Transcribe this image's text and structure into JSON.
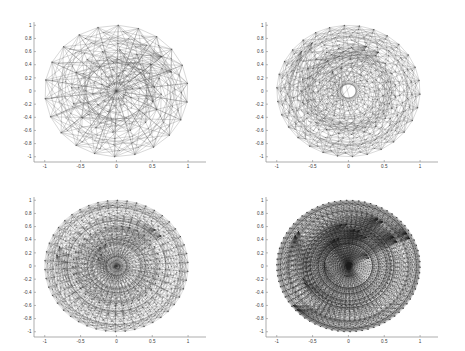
{
  "figure": {
    "title": "",
    "background": "#ffffff",
    "layout": "2x2 subplot grid",
    "width": 465,
    "height": 351
  },
  "chart_data": [
    {
      "type": "scatter",
      "name": "mesh-level-1",
      "position": "top-left",
      "title": "",
      "xlabel": "",
      "ylabel": "",
      "xlim": [
        -1.15,
        1.25
      ],
      "ylim": [
        -1.08,
        1.05
      ],
      "xticks": [
        -1,
        -0.5,
        0,
        0.5,
        1
      ],
      "xticklabels": [
        "-1",
        "-0.5",
        "0",
        "0.5",
        "1"
      ],
      "yticks": [
        -1,
        -0.8,
        -0.6,
        -0.4,
        -0.2,
        0,
        0.2,
        0.4,
        0.6,
        0.8,
        1
      ],
      "yticklabels": [
        "-1",
        "-0.8",
        "-0.6",
        "-0.4",
        "-0.2",
        "0",
        "0.2",
        "0.4",
        "0.6",
        "0.8",
        "1"
      ],
      "grid": false,
      "legend": "none",
      "rings": 9,
      "sectors": 22,
      "inner_radius": 0.11,
      "outer_radius": 1.0,
      "line_color": "#4a4a4a",
      "line_width": 0.22,
      "description": "Sparse circular radial mesh: concentric node rings connected by chords forming a rose/triangulation pattern with circular voids"
    },
    {
      "type": "scatter",
      "name": "mesh-level-2",
      "position": "top-right",
      "title": "",
      "xlabel": "",
      "ylabel": "",
      "xlim": [
        -1.15,
        1.25
      ],
      "ylim": [
        -1.08,
        1.05
      ],
      "xticks": [
        -1,
        -0.5,
        0,
        0.5,
        1
      ],
      "xticklabels": [
        "-1",
        "-0.5",
        "0",
        "0.5",
        "1"
      ],
      "yticks": [
        -1,
        -0.8,
        -0.6,
        -0.4,
        -0.2,
        0,
        0.2,
        0.4,
        0.6,
        0.8,
        1
      ],
      "yticklabels": [
        "-1",
        "-0.8",
        "-0.6",
        "-0.4",
        "-0.2",
        "0",
        "0.2",
        "0.4",
        "0.6",
        "0.8",
        "1"
      ],
      "grid": false,
      "legend": "none",
      "rings": 14,
      "sectors": 30,
      "inner_radius": 0.16,
      "outer_radius": 1.0,
      "line_color": "#3d3d3d",
      "line_width": 0.2,
      "description": "Refined circular radial mesh, roughly double node density, larger central void"
    },
    {
      "type": "scatter",
      "name": "mesh-level-3",
      "position": "bottom-left",
      "title": "",
      "xlabel": "",
      "ylabel": "",
      "xlim": [
        -1.15,
        1.25
      ],
      "ylim": [
        -1.08,
        1.05
      ],
      "xticks": [
        -1,
        -0.5,
        0,
        0.5,
        1
      ],
      "xticklabels": [
        "-1",
        "-0.5",
        "0",
        "0.5",
        "1"
      ],
      "yticks": [
        -1,
        -0.8,
        -0.6,
        -0.4,
        -0.2,
        0,
        0.2,
        0.4,
        0.6,
        0.8,
        1
      ],
      "yticklabels": [
        "-1",
        "-0.8",
        "-0.6",
        "-0.4",
        "-0.2",
        "0",
        "0.2",
        "0.4",
        "0.6",
        "0.8",
        "1"
      ],
      "grid": false,
      "legend": "none",
      "rings": 22,
      "sectors": 46,
      "inner_radius": 0.085,
      "outer_radius": 1.0,
      "line_color": "#343434",
      "line_width": 0.17,
      "description": "Further refined mesh, high node density, small bright central void"
    },
    {
      "type": "scatter",
      "name": "mesh-level-4",
      "position": "bottom-right",
      "title": "",
      "xlabel": "",
      "ylabel": "",
      "xlim": [
        -1.15,
        1.25
      ],
      "ylim": [
        -1.08,
        1.05
      ],
      "xticks": [
        -1,
        -0.5,
        0,
        0.5,
        1
      ],
      "xticklabels": [
        "-1",
        "-0.5",
        "0",
        "0.5",
        "1"
      ],
      "yticks": [
        -1,
        -0.8,
        -0.6,
        -0.4,
        -0.2,
        0,
        0.2,
        0.4,
        0.6,
        0.8,
        1
      ],
      "yticklabels": [
        "-1",
        "-0.8",
        "-0.6",
        "-0.4",
        "-0.2",
        "0",
        "0.2",
        "0.4",
        "0.6",
        "0.8",
        "1"
      ],
      "grid": false,
      "legend": "none",
      "rings": 34,
      "sectors": 74,
      "inner_radius": 0.055,
      "outer_radius": 1.0,
      "line_color": "#1f1f1f",
      "line_width": 0.15,
      "description": "Densest mesh, appears nearly solid dark gray/black with faint concentric banding and tiny central void"
    }
  ],
  "axes": {
    "tick_color": "#8a8a8a",
    "label_color": "#3a3a3a",
    "axis_color": "#8a8a8a"
  }
}
